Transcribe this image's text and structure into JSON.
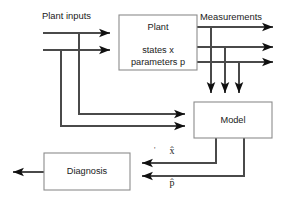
{
  "diagram": {
    "type": "block-diagram",
    "canvas": {
      "width": 288,
      "height": 204,
      "background": "#ffffff"
    },
    "colors": {
      "box_stroke": "#8c8c8c",
      "box_fill": "#ffffff",
      "wire": "#4a4a4a",
      "arrowhead": "#101010",
      "text": "#1a1a1a"
    },
    "blocks": [
      {
        "id": "plant",
        "name": "plant-block",
        "lines": [
          "Plant",
          "states x",
          "parameters p"
        ],
        "x": 119,
        "y": 15,
        "w": 78,
        "h": 55
      },
      {
        "id": "model",
        "name": "model-block",
        "lines": [
          "Model"
        ],
        "x": 194,
        "y": 102,
        "w": 78,
        "h": 36
      },
      {
        "id": "diagnosis",
        "name": "diagnosis-block",
        "lines": [
          "Diagnosis"
        ],
        "x": 44,
        "y": 153,
        "w": 86,
        "h": 37
      }
    ],
    "labels": {
      "plant_inputs": "Plant inputs",
      "measurements": "Measurements",
      "state_estimate": "x̂",
      "parameter_estimate": "p̂",
      "tick_mark": "'"
    },
    "signals": [
      {
        "name": "plant-input-upper",
        "from": "plant inputs",
        "to": "Plant",
        "label": ""
      },
      {
        "name": "plant-input-lower",
        "from": "plant inputs",
        "to": "Plant",
        "label": ""
      },
      {
        "name": "plant-input-upper-to-model",
        "from": "plant inputs",
        "to": "Model",
        "label": ""
      },
      {
        "name": "plant-input-lower-to-model",
        "from": "plant inputs",
        "to": "Model",
        "label": ""
      },
      {
        "name": "measurement-1",
        "from": "Plant",
        "to": "Measurements",
        "label": "Measurements"
      },
      {
        "name": "measurement-2",
        "from": "Plant",
        "to": "Measurements",
        "label": ""
      },
      {
        "name": "measurement-3",
        "from": "Plant",
        "to": "Measurements",
        "label": ""
      },
      {
        "name": "measurement-tap-1",
        "from": "Plant",
        "to": "Model",
        "label": ""
      },
      {
        "name": "measurement-tap-2",
        "from": "Plant",
        "to": "Model",
        "label": ""
      },
      {
        "name": "measurement-tap-3",
        "from": "Plant",
        "to": "Model",
        "label": ""
      },
      {
        "name": "state-estimate-signal",
        "from": "Model",
        "to": "Diagnosis",
        "label": "x̂"
      },
      {
        "name": "parameter-estimate-signal",
        "from": "Model",
        "to": "Diagnosis",
        "label": "p̂"
      },
      {
        "name": "diagnosis-output",
        "from": "Diagnosis",
        "to": "",
        "label": ""
      }
    ]
  }
}
